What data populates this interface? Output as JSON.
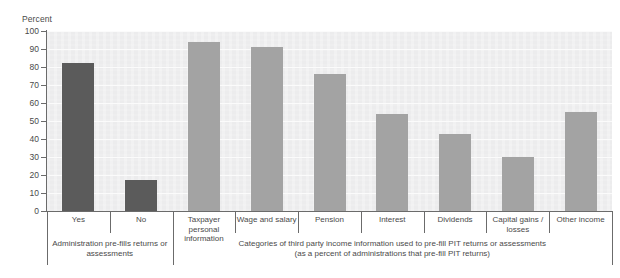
{
  "chart": {
    "axis_title": "Percent",
    "y_ticks": [
      "100",
      "90",
      "80",
      "70",
      "60",
      "50",
      "40",
      "30",
      "20",
      "10",
      "0"
    ],
    "group1_caption_line1": "Administration pre-fills returns or",
    "group1_caption_line2": "assessments",
    "group2_caption_line1": "Categories of third party income information used to pre-fill PIT returns or assessments",
    "group2_caption_line2": "(as a percent of administrations that pre-fill PIT returns)",
    "colors": {
      "group1_bar": "#5b5b5b",
      "group2_bar": "#a3a3a3",
      "plot_background": "#ececed",
      "axis": "#6b6b6b",
      "gridline": "#fbfbfb",
      "text": "#4a4a4a"
    }
  },
  "chart_data": {
    "type": "bar",
    "title": "",
    "subtitle": "",
    "xlabel": "",
    "ylabel": "Percent",
    "ylim": [
      0,
      100
    ],
    "y_tick_step": 10,
    "grid": true,
    "legend": "none",
    "categories": [
      "Yes",
      "No",
      "Taxpayer personal information",
      "Wage and salary",
      "Pension",
      "Interest",
      "Dividends",
      "Capital gains / losses",
      "Other income"
    ],
    "category_labels_wrapped": [
      [
        "Yes"
      ],
      [
        "No"
      ],
      [
        "Taxpayer personal",
        "information"
      ],
      [
        "Wage and salary"
      ],
      [
        "Pension"
      ],
      [
        "Interest"
      ],
      [
        "Dividends"
      ],
      [
        "Capital gains /",
        "losses"
      ],
      [
        "Other income"
      ]
    ],
    "values": [
      82,
      17,
      94,
      91,
      76,
      54,
      43,
      30,
      55
    ],
    "groups": [
      {
        "name": "Administration pre-fills returns or assessments",
        "caption_lines": [
          "Administration pre-fills returns or",
          "assessments"
        ],
        "category_indices": [
          0,
          1
        ],
        "color": "#5b5b5b"
      },
      {
        "name": "Categories of third party income information used to pre-fill PIT returns or assessments",
        "caption_lines": [
          "Categories of third party income information used to pre-fill PIT returns or assessments",
          "(as a percent of administrations that pre-fill PIT returns)"
        ],
        "category_indices": [
          2,
          3,
          4,
          5,
          6,
          7,
          8
        ],
        "color": "#a3a3a3"
      }
    ]
  }
}
